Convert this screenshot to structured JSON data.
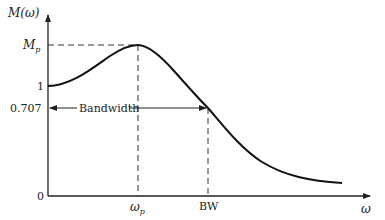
{
  "diagram": {
    "y_axis_label": "M(ω)",
    "x_axis_label": "ω",
    "y_ticks": {
      "mp": "M",
      "mp_sub": "p",
      "one": "1",
      "half_power": "0.707",
      "zero": "0"
    },
    "x_ticks": {
      "wp": "ω",
      "wp_sub": "p",
      "bw": "BW"
    },
    "bandwidth_label": "Bandwidth",
    "colors": {
      "line": "#111111",
      "background": "#ffffff"
    }
  }
}
